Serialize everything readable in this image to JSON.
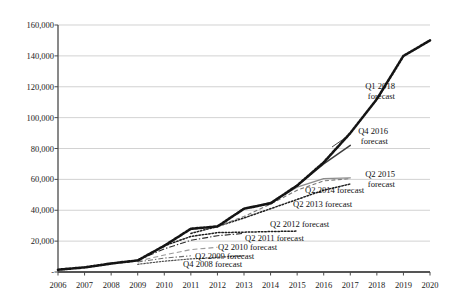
{
  "chart_data": {
    "type": "line",
    "title": "",
    "xlabel": "",
    "ylabel": "",
    "grid": true,
    "legend_position": "inline-annotations",
    "xlim": [
      2006,
      2020
    ],
    "ylim": [
      0,
      160000
    ],
    "x_tick_labels": [
      "2006",
      "2007",
      "2008",
      "2009",
      "2010",
      "2011",
      "2012",
      "2013",
      "2014",
      "2015",
      "2016",
      "2017",
      "2018",
      "2019",
      "2020"
    ],
    "y_tick_labels": [
      "-",
      "20,000",
      "40,000",
      "60,000",
      "80,000",
      "100,000",
      "120,000",
      "140,000",
      "160,000"
    ],
    "y_tick_values": [
      0,
      20000,
      40000,
      60000,
      80000,
      100000,
      120000,
      140000,
      160000
    ],
    "series": [
      {
        "name": "Q1 2018 forecast",
        "style": "thick-dotted-black",
        "x": [
          2006,
          2007,
          2008,
          2009,
          2010,
          2011,
          2012,
          2013,
          2014,
          2015,
          2016,
          2017,
          2018,
          2019,
          2020
        ],
        "values": [
          1500,
          3000,
          5500,
          7500,
          17000,
          28000,
          29500,
          41000,
          44500,
          56000,
          71000,
          90000,
          112000,
          140000,
          150000
        ]
      },
      {
        "name": "Q4 2016 forecast",
        "style": "solid-dark-gray",
        "x": [
          2014,
          2015,
          2016,
          2017
        ],
        "values": [
          44500,
          56000,
          70000,
          82000
        ]
      },
      {
        "name": "Q2 2015 forecast",
        "style": "solid-light-gray",
        "x": [
          2013,
          2014,
          2015,
          2016,
          2017
        ],
        "values": [
          41000,
          45000,
          55000,
          60500,
          61000
        ]
      },
      {
        "name": "Q2 2014 forecast",
        "style": "dashed-gray",
        "x": [
          2012,
          2013,
          2014,
          2015,
          2016,
          2017
        ],
        "values": [
          29500,
          36000,
          44000,
          53000,
          59000,
          60500
        ]
      },
      {
        "name": "Q2 2013 forecast",
        "style": "fine-dotted-black",
        "x": [
          2011,
          2012,
          2013,
          2014,
          2015,
          2016,
          2017
        ],
        "values": [
          25000,
          29500,
          35000,
          41000,
          47000,
          53000,
          57000
        ]
      },
      {
        "name": "Q2 2012 forecast",
        "style": "dotted-black",
        "x": [
          2010,
          2011,
          2012,
          2013,
          2014,
          2015
        ],
        "values": [
          17000,
          23000,
          25500,
          25800,
          26200,
          26500
        ]
      },
      {
        "name": "Q2 2011 forecast",
        "style": "dash-dot-dark",
        "x": [
          2009,
          2010,
          2011,
          2012,
          2013
        ],
        "values": [
          7500,
          15000,
          20500,
          23500,
          25000
        ]
      },
      {
        "name": "Q2 2010 forecast",
        "style": "dashed-light-gray",
        "x": [
          2009,
          2010,
          2011,
          2012
        ],
        "values": [
          7000,
          11000,
          14500,
          16000
        ]
      },
      {
        "name": "Q2 2009 forecast",
        "style": "dash-dot-gray",
        "x": [
          2009,
          2010,
          2011
        ],
        "values": [
          6500,
          9000,
          10500
        ]
      },
      {
        "name": "Q4 2008 forecast",
        "style": "fine-dotted-gray",
        "x": [
          2009,
          2010,
          2011,
          2012,
          2013
        ],
        "values": [
          5000,
          7000,
          8500,
          9500,
          10500
        ]
      }
    ],
    "annotations": [
      {
        "name": "q1-2018-forecast",
        "line1": "Q1 2018",
        "line2": "forecast"
      },
      {
        "name": "q4-2016-forecast",
        "line1": "Q4 2016",
        "line2": "forecast"
      },
      {
        "name": "q2-2015-forecast",
        "line1": "Q2 2015",
        "line2": "forecast"
      },
      {
        "name": "q2-2014-forecast",
        "line1": "Q2 2014 forecast",
        "line2": ""
      },
      {
        "name": "q2-2013-forecast",
        "line1": "Q2 2013 forecast",
        "line2": ""
      },
      {
        "name": "q2-2012-forecast",
        "line1": "Q2 2012 forecast",
        "line2": ""
      },
      {
        "name": "q2-2011-forecast",
        "line1": "Q2 2011 forecast",
        "line2": ""
      },
      {
        "name": "q2-2010-forecast",
        "line1": "Q2 2010 forecast",
        "line2": ""
      },
      {
        "name": "q2-2009-forecast",
        "line1": "Q2 2009 forecast",
        "line2": ""
      },
      {
        "name": "q4-2008-forecast",
        "line1": "Q4 2008 forecast",
        "line2": ""
      }
    ],
    "colors": {
      "main_line": "#141414",
      "secondary_line": "#3d3d3d",
      "tertiary_line": "#8c8c8c",
      "grid": "#bfbfbf",
      "axis": "#4a4a4a",
      "text": "#1a1a1a",
      "background": "#ffffff"
    }
  }
}
